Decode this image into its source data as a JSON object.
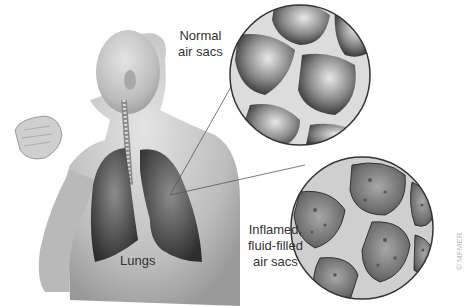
{
  "figure": {
    "labels": {
      "normal": [
        "Normal",
        "air sacs"
      ],
      "inflamed": [
        "Inflamed,",
        "fluid-filled",
        "air sacs"
      ],
      "lungs": "Lungs"
    },
    "copyright": "© MFMER",
    "colors": {
      "background": "#ffffff",
      "skin": "#c9c9c9",
      "lung": "#4a4a4a",
      "text": "#333333",
      "septa": "#e6e6e6"
    }
  }
}
